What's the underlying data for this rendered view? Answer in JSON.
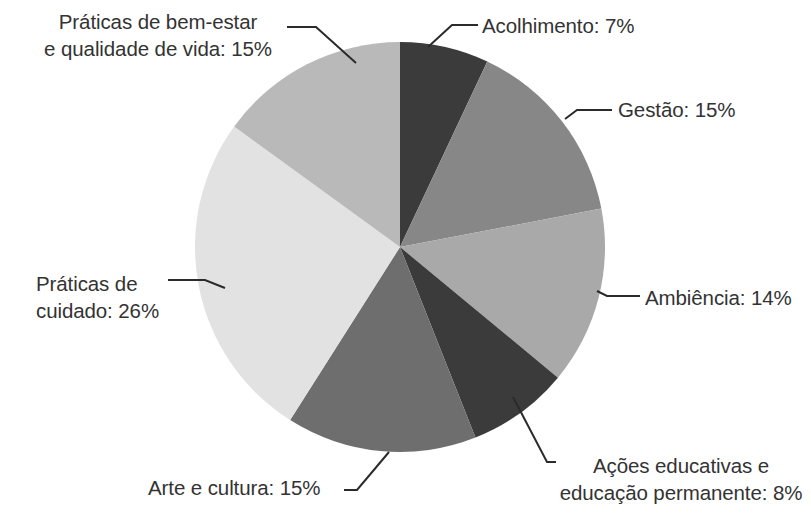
{
  "chart_data": {
    "type": "pie",
    "title": "",
    "subtitle": "",
    "xlabel": "",
    "ylabel": "",
    "legend_position": "none",
    "grid": false,
    "label_format": "{name}: {value}%",
    "start_angle_deg": 0,
    "direction": "clockwise",
    "categories": [
      "Acolhimento",
      "Gestão",
      "Ambiência",
      "Ações educativas e educação permanente",
      "Arte e cultura",
      "Práticas de cuidado",
      "Práticas de bem-estar e qualidade de vida"
    ],
    "values": [
      7,
      15,
      14,
      8,
      15,
      26,
      15
    ],
    "unit": "%",
    "total": 100,
    "slices": [
      {
        "name": "Acolhimento",
        "value": 7,
        "label": "Acolhimento: 7%",
        "color": "#3b3b3b",
        "start_deg": 0,
        "end_deg": 25.2
      },
      {
        "name": "Gestão",
        "value": 15,
        "label": "Gestão: 15%",
        "color": "#878787",
        "start_deg": 25.2,
        "end_deg": 79.2
      },
      {
        "name": "Ambiência",
        "value": 14,
        "label": "Ambiência: 14%",
        "color": "#a9a9a9",
        "start_deg": 79.2,
        "end_deg": 129.6
      },
      {
        "name": "Ações educativas e educação permanente",
        "value": 8,
        "label_line1": "Ações educativas e",
        "label_line2": "educação permanente: 8%",
        "label": "Ações educativas e\neducação permanente: 8%",
        "color": "#3b3b3b",
        "start_deg": 129.6,
        "end_deg": 158.4
      },
      {
        "name": "Arte e cultura",
        "value": 15,
        "label": "Arte e cultura: 15%",
        "color": "#6e6e6e",
        "start_deg": 158.4,
        "end_deg": 212.4
      },
      {
        "name": "Práticas de cuidado",
        "value": 26,
        "label_line1": "Práticas de",
        "label_line2": "cuidado: 26%",
        "label": "Práticas de\ncuidado: 26%",
        "color": "#e2e2e2",
        "start_deg": 212.4,
        "end_deg": 306.0
      },
      {
        "name": "Práticas de bem-estar e qualidade de vida",
        "value": 15,
        "label_line1": "Práticas de bem-estar",
        "label_line2": "e qualidade de vida: 15%",
        "label": "Práticas de bem-estar\ne qualidade de vida: 15%",
        "color": "#b9b9b9",
        "start_deg": 306.0,
        "end_deg": 360.0
      }
    ]
  },
  "style": {
    "background": "#ffffff",
    "text_color": "#333333",
    "leader_line_color": "#2b2b2b"
  }
}
